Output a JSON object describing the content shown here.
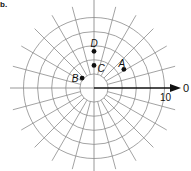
{
  "figure": {
    "corner_label": "b.",
    "axis_end_label": "0",
    "scale_label": "10",
    "center": {
      "x": 94,
      "y": 88
    },
    "px_per_unit": 7.05,
    "rings": [
      2,
      4,
      6,
      8,
      10
    ],
    "spoke_step_deg": 15,
    "spoke_outer_radius_px": 84,
    "grid_color": "#8c8c8c",
    "ink_color": "#111111"
  },
  "points": [
    {
      "label": "A",
      "r": 5,
      "theta_deg": 32,
      "label_dx": -2,
      "label_dy": -6
    },
    {
      "label": "B",
      "r": 2.2,
      "theta_deg": 140,
      "label_dx": -7,
      "label_dy": 0
    },
    {
      "label": "C",
      "r": 3.2,
      "theta_deg": 90,
      "label_dx": 7,
      "label_dy": 3
    },
    {
      "label": "D",
      "r": 5.2,
      "theta_deg": 90,
      "label_dx": 0,
      "label_dy": -8
    }
  ]
}
